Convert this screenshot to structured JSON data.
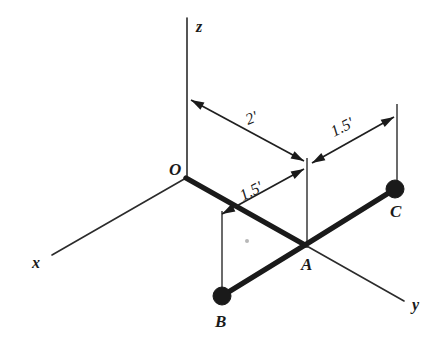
{
  "figure": {
    "background_color": "#ffffff",
    "ink_color": "#1a1a1a",
    "axes": [
      {
        "id": "z",
        "label": "z",
        "label_x": 196,
        "label_y": 32,
        "x1": 187,
        "y1": 18,
        "x2": 187,
        "y2": 178
      },
      {
        "id": "x",
        "label": "x",
        "label_x": 32,
        "label_y": 268,
        "x1": 186,
        "y1": 178,
        "x2": 52,
        "y2": 255
      },
      {
        "id": "y",
        "label": "y",
        "label_x": 412,
        "label_y": 310,
        "x1": 305,
        "y1": 245,
        "x2": 404,
        "y2": 301
      }
    ],
    "nodes": [
      {
        "id": "O",
        "label": "O",
        "x": 186,
        "y": 178,
        "label_x": 169,
        "label_y": 175,
        "dot": false
      },
      {
        "id": "A",
        "label": "A",
        "x": 305,
        "y": 245,
        "label_x": 301,
        "label_y": 270,
        "dot": false
      },
      {
        "id": "B",
        "label": "B",
        "x": 222,
        "y": 296,
        "label_x": 215,
        "label_y": 327,
        "dot": true,
        "dot_r": 9
      },
      {
        "id": "C",
        "label": "C",
        "x": 395,
        "y": 189,
        "label_x": 390,
        "label_y": 217,
        "dot": true,
        "dot_r": 9
      }
    ],
    "members": [
      {
        "id": "OA",
        "from": "O",
        "to": "A"
      },
      {
        "id": "AB",
        "from": "A",
        "to": "B"
      },
      {
        "id": "AC",
        "from": "A",
        "to": "C"
      }
    ],
    "extension_lines": [
      {
        "id": "ext-A",
        "x1": 307,
        "y1": 158,
        "x2": 307,
        "y2": 248
      },
      {
        "id": "ext-B",
        "x1": 222,
        "y1": 211,
        "x2": 222,
        "y2": 292
      },
      {
        "id": "ext-C",
        "x1": 397,
        "y1": 104,
        "x2": 397,
        "y2": 188
      }
    ],
    "dimensions": [
      {
        "id": "dim-2ft",
        "label": "2'",
        "label_x": 248,
        "label_y": 125,
        "label_rotate": -22,
        "x1": 191,
        "y1": 100,
        "x2": 304,
        "y2": 161,
        "arrow_start": true,
        "arrow_end": true,
        "measures": "O to A horizontal projection"
      },
      {
        "id": "dim-1p5ft-upper-right",
        "label": "1.5'",
        "label_x": 334,
        "label_y": 137,
        "label_rotate": -27,
        "x1": 312,
        "y1": 163,
        "x2": 394,
        "y2": 117,
        "arrow_start": true,
        "arrow_end": true,
        "measures": "A to C"
      },
      {
        "id": "dim-1p5ft-lower-left",
        "label": "1.5'",
        "label_x": 243,
        "label_y": 201,
        "label_rotate": -27,
        "x1": 222,
        "y1": 214,
        "x2": 304,
        "y2": 169,
        "arrow_start": true,
        "arrow_end": true,
        "measures": "A to B"
      }
    ],
    "speck": {
      "x": 247,
      "y": 241,
      "r": 2
    }
  }
}
